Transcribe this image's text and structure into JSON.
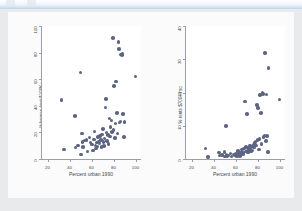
{
  "chrome": {
    "tab_left_name": "ghost-tab-1",
    "tab_right_name": "ghost-tab-2"
  },
  "figure": {
    "background_color": "#fbfbfb",
    "page_background_color": "#e9eaec",
    "marker_color": "#5b6482",
    "axis_color": "#9aa0a6"
  },
  "chart_data": [
    {
      "type": "scatter",
      "panel": "left",
      "title": "",
      "xlabel": "Percent urban 1990",
      "ylabel": "% homes cost $100K+",
      "xlim": [
        15,
        105
      ],
      "ylim": [
        0,
        100
      ],
      "xticks": [
        20,
        40,
        60,
        80,
        100
      ],
      "yticks": [
        0,
        20,
        40,
        60,
        80,
        100
      ],
      "grid": false,
      "legend": "none",
      "points": [
        [
          32.6,
          44.5
        ],
        [
          34.9,
          7.1
        ],
        [
          44.9,
          32.2
        ],
        [
          45.6,
          8.6
        ],
        [
          47.6,
          10.3
        ],
        [
          49.9,
          65.1
        ],
        [
          50.5,
          3.4
        ],
        [
          51.2,
          19.3
        ],
        [
          51.9,
          12.6
        ],
        [
          52.5,
          9.1
        ],
        [
          53.8,
          13.8
        ],
        [
          55.3,
          14.4
        ],
        [
          56.4,
          5.6
        ],
        [
          58.1,
          16.1
        ],
        [
          59.2,
          12.3
        ],
        [
          60.3,
          11.0
        ],
        [
          61.3,
          6.5
        ],
        [
          62.1,
          14.8
        ],
        [
          62.8,
          20.8
        ],
        [
          63.5,
          10.2
        ],
        [
          64.1,
          7.8
        ],
        [
          64.8,
          12.4
        ],
        [
          65.3,
          9.3
        ],
        [
          66.0,
          16.6
        ],
        [
          66.6,
          13.2
        ],
        [
          67.1,
          11.8
        ],
        [
          67.8,
          17.3
        ],
        [
          68.4,
          14.1
        ],
        [
          69.0,
          8.8
        ],
        [
          69.6,
          18.4
        ],
        [
          70.2,
          22.5
        ],
        [
          70.9,
          12.9
        ],
        [
          71.4,
          9.7
        ],
        [
          72.0,
          15.5
        ],
        [
          72.6,
          38.7
        ],
        [
          73.1,
          45.1
        ],
        [
          73.8,
          19.8
        ],
        [
          74.3,
          13.5
        ],
        [
          75.0,
          17.9
        ],
        [
          75.6,
          11.4
        ],
        [
          76.2,
          30.6
        ],
        [
          76.8,
          16.9
        ],
        [
          77.4,
          24.2
        ],
        [
          78.1,
          28.9
        ],
        [
          78.7,
          20.3
        ],
        [
          79.3,
          91.2
        ],
        [
          80.0,
          21.7
        ],
        [
          80.6,
          55.1
        ],
        [
          81.2,
          15.9
        ],
        [
          81.9,
          26.8
        ],
        [
          82.5,
          58.3
        ],
        [
          83.1,
          34.6
        ],
        [
          83.8,
          19.1
        ],
        [
          84.4,
          87.9
        ],
        [
          85.0,
          82.7
        ],
        [
          85.6,
          27.4
        ],
        [
          86.2,
          28.1
        ],
        [
          86.9,
          78.6
        ],
        [
          87.5,
          78.2
        ],
        [
          88.1,
          78.8
        ],
        [
          88.8,
          34.0
        ],
        [
          89.4,
          16.4
        ],
        [
          90.1,
          27.9
        ],
        [
          100.0,
          62.1
        ]
      ]
    },
    {
      "type": "scatter",
      "panel": "right",
      "title": "",
      "xlabel": "Percent urban 1990",
      "ylabel": "% rents $700+/mo",
      "xlim": [
        15,
        105
      ],
      "ylim": [
        0,
        40
      ],
      "xticks": [
        20,
        40,
        60,
        80,
        100
      ],
      "yticks": [
        0,
        10,
        20,
        30,
        40
      ],
      "grid": false,
      "legend": "none",
      "points": [
        [
          32.6,
          3.2
        ],
        [
          34.9,
          0.6
        ],
        [
          44.9,
          1.9
        ],
        [
          45.6,
          1.0
        ],
        [
          47.6,
          1.2
        ],
        [
          49.9,
          2.1
        ],
        [
          50.5,
          0.8
        ],
        [
          51.2,
          9.9
        ],
        [
          51.9,
          1.4
        ],
        [
          52.5,
          0.9
        ],
        [
          53.8,
          1.1
        ],
        [
          55.3,
          1.6
        ],
        [
          56.4,
          0.7
        ],
        [
          58.1,
          1.3
        ],
        [
          59.2,
          1.0
        ],
        [
          60.3,
          1.5
        ],
        [
          61.3,
          0.8
        ],
        [
          62.1,
          2.4
        ],
        [
          62.8,
          1.7
        ],
        [
          63.5,
          1.2
        ],
        [
          64.1,
          0.9
        ],
        [
          64.8,
          2.0
        ],
        [
          65.3,
          1.4
        ],
        [
          66.0,
          2.8
        ],
        [
          66.6,
          1.8
        ],
        [
          67.1,
          1.5
        ],
        [
          67.8,
          3.1
        ],
        [
          68.4,
          17.3
        ],
        [
          69.0,
          2.2
        ],
        [
          69.6,
          3.6
        ],
        [
          70.2,
          13.6
        ],
        [
          70.9,
          2.6
        ],
        [
          71.4,
          1.9
        ],
        [
          72.0,
          3.3
        ],
        [
          72.6,
          2.7
        ],
        [
          73.1,
          4.0
        ],
        [
          73.8,
          3.0
        ],
        [
          74.3,
          2.3
        ],
        [
          75.0,
          3.8
        ],
        [
          75.6,
          2.5
        ],
        [
          76.2,
          4.4
        ],
        [
          76.8,
          3.5
        ],
        [
          77.4,
          4.8
        ],
        [
          78.1,
          5.2
        ],
        [
          78.8,
          4.1
        ],
        [
          79.3,
          16.3
        ],
        [
          80.0,
          5.7
        ],
        [
          80.6,
          15.4
        ],
        [
          81.2,
          2.9
        ],
        [
          81.9,
          6.1
        ],
        [
          82.5,
          19.3
        ],
        [
          83.1,
          13.9
        ],
        [
          83.8,
          4.6
        ],
        [
          84.4,
          19.9
        ],
        [
          85.0,
          19.6
        ],
        [
          85.6,
          6.6
        ],
        [
          86.2,
          7.1
        ],
        [
          86.9,
          31.8
        ],
        [
          87.5,
          5.4
        ],
        [
          88.1,
          19.4
        ],
        [
          88.8,
          6.9
        ],
        [
          89.4,
          2.1
        ],
        [
          90.1,
          27.4
        ],
        [
          100.0,
          17.9
        ]
      ]
    }
  ]
}
